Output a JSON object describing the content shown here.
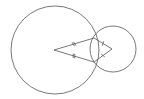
{
  "diagram": {
    "type": "geometry",
    "stroke_color": "#555555",
    "background": "#ffffff",
    "large_circle": {
      "cx": 55,
      "cy": 50,
      "r": 44
    },
    "small_circle": {
      "cx": 113,
      "cy": 49,
      "r": 23
    },
    "kite": {
      "left_vertex": [
        54,
        50
      ],
      "top_vertex": [
        94,
        38
      ],
      "right_vertex": [
        112,
        49
      ],
      "bottom_vertex": [
        94,
        62
      ]
    },
    "tick_marks": {
      "long_sides": "double",
      "short_sides": "single"
    }
  }
}
